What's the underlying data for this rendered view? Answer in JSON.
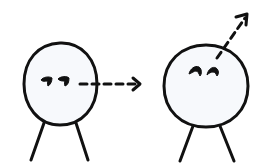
{
  "diagram": {
    "colors": {
      "ink": "#111111",
      "head_fill": "#f7f9fc",
      "background": "#ffffff"
    },
    "figures": [
      {
        "id": "left",
        "gaze": "sideways",
        "head": {
          "cx": 61,
          "cy": 84,
          "rx": 37,
          "ry": 41
        },
        "eyes": [
          {
            "x": 46,
            "y": 82
          },
          {
            "x": 65,
            "y": 82
          }
        ],
        "legs": [
          [
            44,
            124,
            31,
            160
          ],
          [
            76,
            124,
            88,
            160
          ]
        ],
        "gaze_arrow": {
          "from": [
            80,
            84
          ],
          "to": [
            140,
            84
          ]
        }
      },
      {
        "id": "right",
        "gaze": "upward",
        "head": {
          "cx": 206,
          "cy": 86,
          "rx": 42,
          "ry": 41
        },
        "eyes": [
          {
            "x": 197,
            "y": 70
          },
          {
            "x": 214,
            "y": 70
          }
        ],
        "legs": [
          [
            193,
            127,
            180,
            161
          ],
          [
            220,
            127,
            234,
            161
          ]
        ],
        "gaze_arrow": {
          "from": [
            217,
            58
          ],
          "to": [
            247,
            15
          ]
        }
      }
    ]
  }
}
